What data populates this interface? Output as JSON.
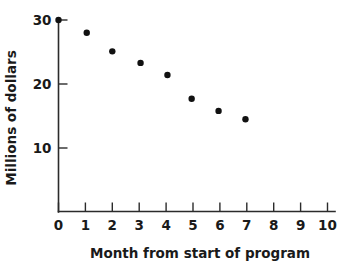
{
  "chart_data": {
    "type": "scatter",
    "title": "",
    "xlabel": "Month from start of program",
    "ylabel": "Millions of dollars",
    "xlim": [
      0,
      10.6
    ],
    "ylim": [
      0,
      31.5
    ],
    "grid": false,
    "legend": null,
    "x_ticks": [
      "0",
      "1",
      "2",
      "3",
      "4",
      "5",
      "6",
      "7",
      "8",
      "9",
      "10"
    ],
    "x_tick_values": [
      0,
      1,
      2,
      3,
      4,
      5,
      6,
      7,
      8,
      9,
      10
    ],
    "y_ticks": [
      "10",
      "20",
      "30"
    ],
    "y_tick_values": [
      10,
      20,
      30
    ],
    "series": [
      {
        "name": "Program spending",
        "marker": "filled-circle",
        "color": "#111111",
        "points": [
          {
            "x": 0.0,
            "y": 30.0
          },
          {
            "x": 1.05,
            "y": 28.0
          },
          {
            "x": 2.0,
            "y": 25.1
          },
          {
            "x": 3.05,
            "y": 23.3
          },
          {
            "x": 4.05,
            "y": 21.4
          },
          {
            "x": 4.95,
            "y": 17.7
          },
          {
            "x": 5.95,
            "y": 15.8
          },
          {
            "x": 6.95,
            "y": 14.5
          }
        ]
      }
    ]
  },
  "axes": {
    "x_axis_name": "x-axis",
    "y_axis_name": "y-axis"
  }
}
